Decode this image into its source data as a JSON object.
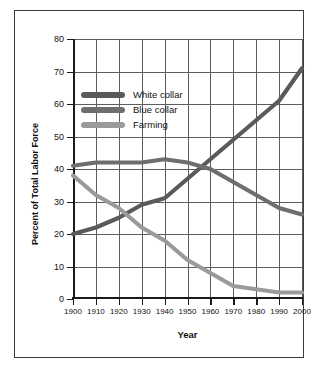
{
  "chart_data": {
    "type": "line",
    "title": "",
    "xlabel": "Year",
    "ylabel": "Percent of Total Labor Force",
    "x": [
      1900,
      1910,
      1920,
      1930,
      1940,
      1950,
      1960,
      1970,
      1980,
      1990,
      2000
    ],
    "xlim": [
      1900,
      2000
    ],
    "ylim": [
      0,
      80
    ],
    "yticks": [
      0,
      10,
      20,
      30,
      40,
      50,
      60,
      70,
      80
    ],
    "xticks": [
      "1900",
      "1910",
      "1920",
      "1930",
      "1940",
      "1950",
      "1960",
      "1970",
      "1980",
      "1990",
      "2000"
    ],
    "grid": true,
    "legend_position": "upper-left-inside",
    "series": [
      {
        "name": "White collar",
        "color": "#5a5a5a",
        "values": [
          20,
          22,
          25,
          29,
          31,
          37,
          43,
          49,
          55,
          61,
          71
        ]
      },
      {
        "name": "Blue collar",
        "color": "#6e6e6e",
        "values": [
          41,
          42,
          42,
          42,
          43,
          42,
          40,
          36,
          32,
          28,
          26
        ]
      },
      {
        "name": "Farming",
        "color": "#9a9a9a",
        "values": [
          38,
          32,
          28,
          22,
          18,
          12,
          8,
          4,
          3,
          2,
          2
        ]
      }
    ]
  },
  "legend": {
    "items": [
      {
        "label": "White collar"
      },
      {
        "label": "Blue collar"
      },
      {
        "label": "Farming"
      }
    ]
  },
  "colors": {
    "white_collar": "#5a5a5a",
    "blue_collar": "#6e6e6e",
    "farming": "#9a9a9a",
    "grid": "#5d5d5d",
    "axis": "#1a1a1a",
    "border": "#3b3b3b",
    "background": "#ffffff"
  }
}
